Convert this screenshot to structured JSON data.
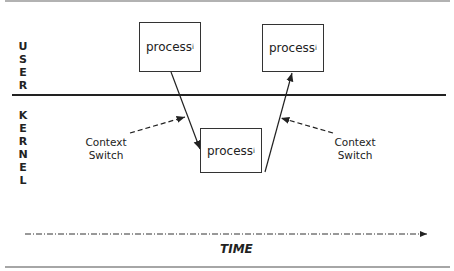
{
  "diagram": {
    "regions": {
      "user": [
        "U",
        "S",
        "E",
        "R"
      ],
      "kernel": [
        "K",
        "E",
        "R",
        "N",
        "E",
        "L"
      ]
    },
    "processes": [
      {
        "id": "user-left",
        "label": "process",
        "subscript": "i"
      },
      {
        "id": "kernel",
        "label": "process",
        "subscript": "i"
      },
      {
        "id": "user-right",
        "label": "process",
        "subscript": "i"
      }
    ],
    "context_switch_left": {
      "line1": "Context",
      "line2": "Switch"
    },
    "context_switch_right": {
      "line1": "Context",
      "line2": "Switch"
    },
    "time_label": "TIME"
  }
}
